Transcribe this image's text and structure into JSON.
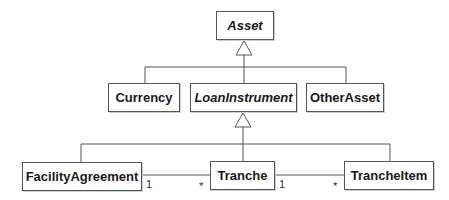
{
  "diagram": {
    "type": "UML class diagram",
    "classes": [
      {
        "id": "asset",
        "name": "Asset",
        "abstract": true
      },
      {
        "id": "currency",
        "name": "Currency",
        "abstract": false
      },
      {
        "id": "loaninstrument",
        "name": "LoanInstrument",
        "abstract": true
      },
      {
        "id": "otherasset",
        "name": "OtherAsset",
        "abstract": false
      },
      {
        "id": "facilityagreement",
        "name": "FacilityAgreement",
        "abstract": false
      },
      {
        "id": "tranche",
        "name": "Tranche",
        "abstract": false
      },
      {
        "id": "trancheitem",
        "name": "TrancheItem",
        "abstract": false
      }
    ],
    "generalizations": [
      {
        "parent": "Asset",
        "children": [
          "Currency",
          "LoanInstrument",
          "OtherAsset"
        ]
      },
      {
        "parent": "LoanInstrument",
        "children": [
          "FacilityAgreement",
          "Tranche",
          "TrancheItem"
        ]
      }
    ],
    "associations": [
      {
        "from": "FacilityAgreement",
        "to": "Tranche",
        "from_mult": "1",
        "to_mult": "*"
      },
      {
        "from": "Tranche",
        "to": "TrancheItem",
        "from_mult": "1",
        "to_mult": "*"
      }
    ],
    "colors": {
      "line": "#555555",
      "text": "#1a1a1a",
      "background": "#ffffff"
    }
  }
}
